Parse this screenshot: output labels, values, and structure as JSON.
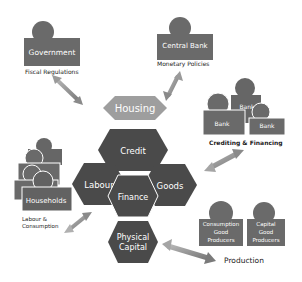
{
  "colors": {
    "background": "#ffffff",
    "figure": "#6a6a6a",
    "figure_dark": "#555555",
    "hex_dark": "#4a4a4a",
    "hex_housing": "#9a9a9a",
    "arrow": "#8a8a8a",
    "caption": "#222222",
    "label": "#ffffff"
  },
  "actors": {
    "government": {
      "label": "Government",
      "caption": "Fiscal Regulations"
    },
    "central_bank": {
      "label": "Central Bank",
      "caption": "Monetary Policies"
    },
    "banks": {
      "labels": [
        "Bank",
        "Bank",
        "Bank"
      ],
      "caption": "Crediting & Financing"
    },
    "households": {
      "label": "Households",
      "caption_line1": "Labour &",
      "caption_line2": "Consumption"
    },
    "consumption_producers": {
      "line1": "Consumption",
      "line2": "Good",
      "line3": "Producers"
    },
    "capital_producers": {
      "line1": "Capital",
      "line2": "Good",
      "line3": "Producers"
    },
    "production": {
      "caption": "Production"
    }
  },
  "markets": {
    "housing": "Housing",
    "credit": "Credit",
    "labour": "Labour",
    "goods": "Goods",
    "finance": "Finance",
    "physical_capital_line1": "Physical",
    "physical_capital_line2": "Capital"
  }
}
